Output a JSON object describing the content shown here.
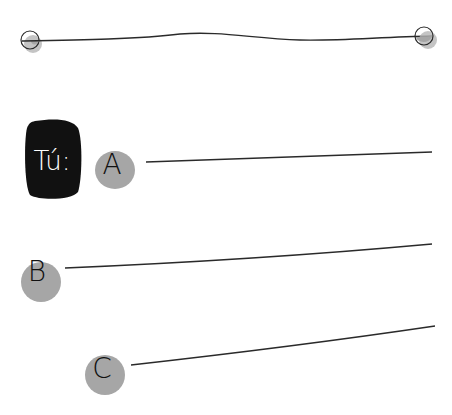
{
  "worksheet": {
    "you_label": "Tú:",
    "options": [
      {
        "letter": "A"
      },
      {
        "letter": "B"
      },
      {
        "letter": "C"
      }
    ]
  },
  "colors": {
    "ink": "#1a1a1a",
    "dot_fill": "#a6a6a6",
    "badge_bg": "#111111",
    "badge_text": "#ffffff"
  }
}
